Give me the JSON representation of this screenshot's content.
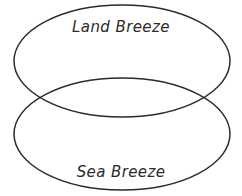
{
  "diagram": {
    "type": "venn-2-set-vertical",
    "background_color": "#ffffff",
    "stroke_color": "#2b2b2b",
    "stroke_width": 1.5,
    "text_color": "#2b2b2b",
    "sets": [
      {
        "id": "top",
        "label": "Land Breeze",
        "center_x": 122,
        "center_y": 61,
        "radius_x": 108,
        "radius_y": 56
      },
      {
        "id": "bottom",
        "label": "Sea Breeze",
        "center_x": 122,
        "center_y": 134,
        "radius_x": 108,
        "radius_y": 56
      }
    ],
    "overlap_region_label": ""
  }
}
